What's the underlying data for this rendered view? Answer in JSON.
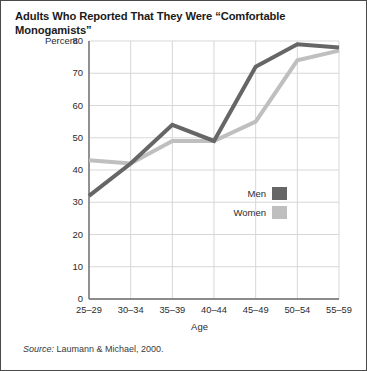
{
  "title": "Adults Who Reported That They Were “Comfortable Monogamists”",
  "percent_label": "Percent",
  "source": {
    "prefix": "Source:",
    "text": " Laumann & Michael, 2000."
  },
  "legend": {
    "men_label": "Men",
    "women_label": "Women",
    "men_color": "#666666",
    "women_color": "#bfbfbf"
  },
  "chart_data": {
    "type": "line",
    "title": "Adults Who Reported That They Were “Comfortable Monogamists”",
    "xlabel": "Age",
    "ylabel": "Percent",
    "categories": [
      "25–29",
      "30–34",
      "35–39",
      "40–44",
      "45–49",
      "50–54",
      "55–59"
    ],
    "ylim": [
      0,
      80
    ],
    "yticks": [
      0,
      10,
      20,
      30,
      40,
      50,
      60,
      70,
      80
    ],
    "ytick_labels": [
      "0",
      "10",
      "20",
      "30",
      "40",
      "50",
      "60",
      "70",
      "80"
    ],
    "grid": true,
    "legend_position": "inside-right",
    "series": [
      {
        "name": "Men",
        "color": "#666666",
        "values": [
          32,
          42,
          54,
          49,
          72,
          79,
          78
        ]
      },
      {
        "name": "Women",
        "color": "#bfbfbf",
        "values": [
          43,
          42,
          49,
          49,
          55,
          74,
          77
        ]
      }
    ],
    "annotations": [
      "Source: Laumann & Michael, 2000."
    ]
  }
}
